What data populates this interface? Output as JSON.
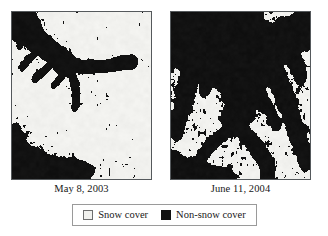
{
  "figure": {
    "type": "satellite-image-comparison",
    "panels": [
      {
        "id": "panel-left",
        "caption": "May 8, 2003",
        "alt_name": "snow-cover-map-2003",
        "snow_fraction": 0.8
      },
      {
        "id": "panel-right",
        "caption": "June 11, 2004",
        "alt_name": "snow-cover-map-2004",
        "snow_fraction": 0.46
      }
    ]
  },
  "legend": {
    "entries": [
      {
        "label": "Snow cover",
        "color": "#f1f1ee",
        "swatch": "snow-swatch"
      },
      {
        "label": "Non-snow cover",
        "color": "#111111",
        "swatch": "non-snow-swatch"
      }
    ]
  },
  "colors": {
    "snow": "#f1f1ee",
    "non_snow": "#111111",
    "panel_border": "#55595c",
    "legend_border": "#9a9a9a",
    "background": "#ffffff",
    "text": "#171717"
  },
  "chart_data": {
    "type": "heatmap",
    "title": "",
    "xlabel": "",
    "ylabel": "",
    "categories": [
      "Snow cover",
      "Non-snow cover"
    ],
    "series": [
      {
        "name": "May 8, 2003",
        "values": [
          80,
          20
        ]
      },
      {
        "name": "June 11, 2004",
        "values": [
          46,
          54
        ]
      }
    ],
    "legend_position": "bottom",
    "grid": false
  }
}
